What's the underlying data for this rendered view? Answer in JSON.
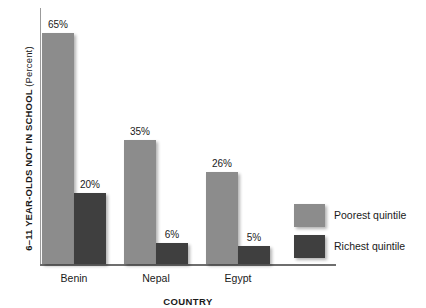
{
  "chart_data": {
    "type": "bar",
    "title": "",
    "xlabel": "COUNTRY",
    "ylabel": "6–11 YEAR-OLDS NOT IN SCHOOL",
    "ylabel_unit": "(Percent)",
    "categories": [
      "Benin",
      "Nepal",
      "Egypt"
    ],
    "series": [
      {
        "name": "Poorest quintile",
        "color": "#8c8c8c",
        "values": [
          65,
          35,
          26
        ],
        "value_labels": [
          "65%",
          "35%",
          "26%"
        ]
      },
      {
        "name": "Richest quintile",
        "color": "#3f3f3f",
        "values": [
          20,
          6,
          5
        ],
        "value_labels": [
          "20%",
          "6%",
          "5%"
        ]
      }
    ],
    "ylim": [
      0,
      72
    ],
    "grid": false,
    "legend_position": "right-bottom"
  },
  "legend": {
    "items": [
      {
        "label": "Poorest quintile"
      },
      {
        "label": "Richest quintile"
      }
    ]
  }
}
